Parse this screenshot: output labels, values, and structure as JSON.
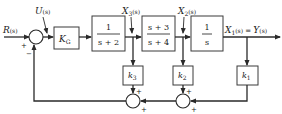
{
  "diagram": {
    "type": "control-system-block-diagram",
    "signals": {
      "input": "R(s)",
      "control": "U(s)",
      "x3": "X3(s)",
      "x2": "X2(s)",
      "output": "X1(s) = Y(s)"
    },
    "labels": {
      "R": "R",
      "R_arg": "(s)",
      "U": "U",
      "U_arg": "(s)",
      "X3": "X",
      "X3_sub": "3",
      "X3_arg": "(s)",
      "X2": "X",
      "X2_sub": "2",
      "X2_arg": "(s)",
      "X1": "X",
      "X1_sub": "1",
      "X1_arg": "(s)",
      "eq": " = ",
      "Y": "Y",
      "Y_arg": "(s)"
    },
    "blocks": {
      "gain": {
        "name": "K",
        "sub": "G"
      },
      "g1": {
        "num": "1",
        "den": "s + 2"
      },
      "g2": {
        "num": "s + 3",
        "den": "s + 4"
      },
      "g3": {
        "num": "1",
        "den": "s"
      },
      "k3": {
        "name": "k",
        "sub": "3"
      },
      "k2": {
        "name": "k",
        "sub": "2"
      },
      "k1": {
        "name": "k",
        "sub": "1"
      }
    },
    "signs": {
      "main_ref": "+",
      "main_fb": "−",
      "sum_left_top": "+",
      "sum_left_right": "+",
      "sum_right_top": "+",
      "sum_right_right": "+"
    }
  }
}
